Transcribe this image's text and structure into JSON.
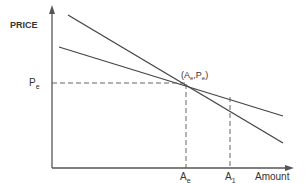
{
  "diagram": {
    "y_axis_label": "PRICE",
    "x_axis_label": "Amount",
    "price_label": {
      "main": "P",
      "sub": "e"
    },
    "point_label": {
      "open": "(A",
      "sub1": "e",
      "mid": ",P",
      "sub2": "e",
      "close": ")"
    },
    "x_tick_ae": {
      "main": "A",
      "sub": "e"
    },
    "x_tick_a1": {
      "main": "A",
      "sub": "1"
    },
    "lines": [
      {
        "name": "steep-line",
        "from": [
          68,
          15
        ],
        "to": [
          283,
          143
        ]
      },
      {
        "name": "shallow-line",
        "from": [
          59,
          47
        ],
        "to": [
          283,
          116
        ]
      }
    ],
    "colors": {
      "line": "#444444",
      "axis": "#555555",
      "text": "#333333"
    }
  }
}
